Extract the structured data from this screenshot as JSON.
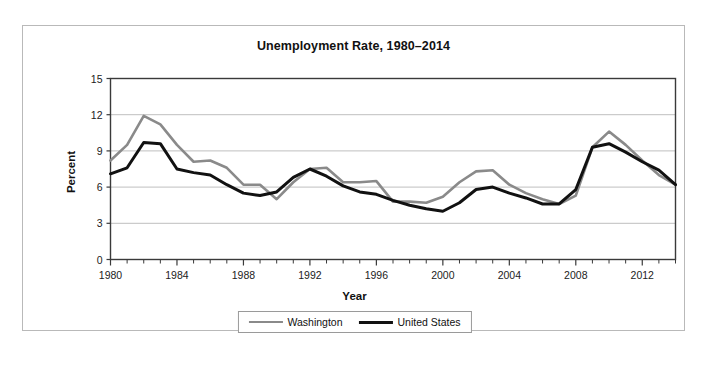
{
  "figure": {
    "title": "Unemployment Rate, 1980–2014",
    "xlabel": "Year",
    "ylabel": "Percent"
  },
  "legend": {
    "items": [
      {
        "label": "Washington",
        "color": "#8a8a8a"
      },
      {
        "label": "United States",
        "color": "#111111"
      }
    ]
  },
  "axis": {
    "y_ticks": [
      "0",
      "3",
      "6",
      "9",
      "12",
      "15"
    ],
    "x_ticks": [
      "1980",
      "1984",
      "1988",
      "1992",
      "1996",
      "2000",
      "2004",
      "2008",
      "2012"
    ]
  },
  "chart_data": {
    "type": "line",
    "title": "Unemployment Rate, 1980–2014",
    "xlabel": "Year",
    "ylabel": "Percent",
    "xlim": [
      1980,
      2014
    ],
    "ylim": [
      0,
      15
    ],
    "ytick_interval": 3,
    "xtick_label_interval": 4,
    "xtick_minor_interval": 1,
    "grid": "horizontal",
    "legend_position": "bottom-center",
    "x": [
      1980,
      1981,
      1982,
      1983,
      1984,
      1985,
      1986,
      1987,
      1988,
      1989,
      1990,
      1991,
      1992,
      1993,
      1994,
      1995,
      1996,
      1997,
      1998,
      1999,
      2000,
      2001,
      2002,
      2003,
      2004,
      2005,
      2006,
      2007,
      2008,
      2009,
      2010,
      2011,
      2012,
      2013,
      2014
    ],
    "series": [
      {
        "name": "Washington",
        "color": "#8a8a8a",
        "values": [
          8.2,
          9.5,
          11.9,
          11.2,
          9.5,
          8.1,
          8.2,
          7.6,
          6.2,
          6.2,
          5.0,
          6.4,
          7.5,
          7.6,
          6.4,
          6.4,
          6.5,
          4.8,
          4.8,
          4.7,
          5.2,
          6.4,
          7.3,
          7.4,
          6.2,
          5.5,
          5.0,
          4.6,
          5.3,
          9.3,
          10.6,
          9.5,
          8.2,
          7.0,
          6.2
        ]
      },
      {
        "name": "United States",
        "color": "#111111",
        "values": [
          7.1,
          7.6,
          9.7,
          9.6,
          7.5,
          7.2,
          7.0,
          6.2,
          5.5,
          5.3,
          5.6,
          6.8,
          7.5,
          6.9,
          6.1,
          5.6,
          5.4,
          4.9,
          4.5,
          4.2,
          4.0,
          4.7,
          5.8,
          6.0,
          5.5,
          5.1,
          4.6,
          4.6,
          5.8,
          9.3,
          9.6,
          8.9,
          8.1,
          7.4,
          6.2
        ]
      }
    ]
  }
}
